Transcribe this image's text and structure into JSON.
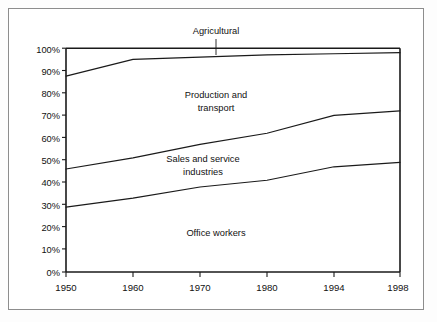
{
  "chart_data": {
    "type": "area",
    "title": "",
    "subtitle": "",
    "xlabel": "",
    "ylabel": "",
    "grid": false,
    "legend_position": "inline-labels",
    "stacked": true,
    "x": [
      1950,
      1960,
      1970,
      1980,
      1994,
      1998
    ],
    "xticklabels": [
      "1950",
      "1960",
      "1970",
      "1980",
      "1994",
      "1998"
    ],
    "xlim": [
      1950,
      1998
    ],
    "ylim": [
      0,
      100
    ],
    "yticks": [
      0,
      10,
      20,
      30,
      40,
      50,
      60,
      70,
      80,
      90,
      100
    ],
    "yticklabels": [
      "0%",
      "10%",
      "20%",
      "30%",
      "40%",
      "50%",
      "60%",
      "70%",
      "80%",
      "90%",
      "100%"
    ],
    "cumulative_boundaries": [
      {
        "name": "Office workers upper boundary",
        "values": [
          29,
          33,
          38,
          41,
          47,
          49
        ]
      },
      {
        "name": "Sales and service industries upper boundary",
        "values": [
          46,
          51,
          57,
          62,
          70,
          72
        ]
      },
      {
        "name": "Production and transport upper boundary",
        "values": [
          87.5,
          95,
          96,
          97,
          97.5,
          98
        ]
      },
      {
        "name": "Agricultural upper boundary",
        "values": [
          100,
          100,
          100,
          100,
          100,
          100
        ]
      }
    ],
    "series": [
      {
        "name": "Office workers",
        "values": [
          29,
          33,
          38,
          41,
          47,
          49
        ]
      },
      {
        "name": "Sales and service industries",
        "values": [
          17,
          18,
          19,
          21,
          23,
          23
        ]
      },
      {
        "name": "Production and transport",
        "values": [
          41.5,
          44,
          39,
          35,
          27.5,
          26
        ]
      },
      {
        "name": "Agricultural",
        "values": [
          12.5,
          5,
          4,
          3,
          2.5,
          2
        ]
      }
    ],
    "band_labels": [
      {
        "text_line1": "Production and",
        "text_line2": "transport",
        "x_pct": 50,
        "y_pct": 79
      },
      {
        "text_line1": "Sales and service",
        "text_line2": "industries",
        "x_pct": 46,
        "y_pct": 53
      },
      {
        "text_line1": "Office workers",
        "text_line2": "",
        "x_pct": 50,
        "y_pct": 21
      }
    ],
    "callouts": [
      {
        "label": "Agricultural",
        "points_to_series": "Agricultural",
        "x_pct": 44,
        "y_pct": 113
      }
    ],
    "colors": {
      "line": "#1a1a1a",
      "axis": "#1a1a1a",
      "background": "#ffffff",
      "frame": "#8d8d8d"
    }
  },
  "labels": {
    "agricultural": "Agricultural",
    "production_1": "Production and",
    "production_2": "transport",
    "sales_1": "Sales and service",
    "sales_2": "industries",
    "office": "Office workers",
    "y": {
      "y100": "100%",
      "y90": "90%",
      "y80": "80%",
      "y70": "70%",
      "y60": "60%",
      "y50": "50%",
      "y40": "40%",
      "y30": "30%",
      "y20": "20%",
      "y10": "10%",
      "y0": "0%"
    },
    "x": {
      "x1950": "1950",
      "x1960": "1960",
      "x1970": "1970",
      "x1980": "1980",
      "x1994": "1994",
      "x1998": "1998"
    }
  }
}
